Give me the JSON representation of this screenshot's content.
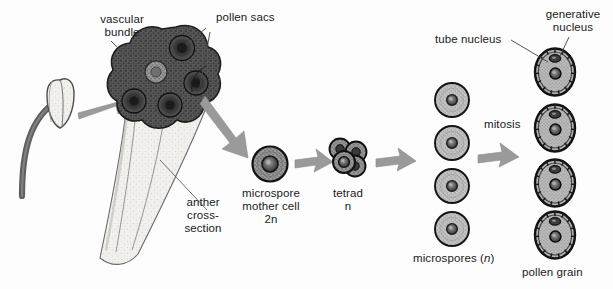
{
  "figure": {
    "background_color": "#fdfdfd",
    "ink_color": "#1a1a1a"
  },
  "colors": {
    "arrow_gray": "#9a9a9a",
    "arrow_gray_dark": "#8b8b8b",
    "sac_dark": "#555555",
    "sac_core": "#2e2e2e",
    "tissue_mid": "#6f6f6f",
    "cell_light": "#b5b5b5",
    "cell_mid": "#8e8e8e",
    "nucleus_dark": "#3a3a3a",
    "filament": "#6b6b6b",
    "anther_pale": "#e8e6e0",
    "leader_line": "#4a4a4a",
    "outline": "#111111"
  },
  "labels": {
    "vascular_bundle": "vascular\nbundle",
    "pollen_sacs": "pollen sacs",
    "anther_cross_section": "anther\ncross-\nsection",
    "microspore_mother_cell": "microspore\nmother cell\n2n",
    "tetrad": "tetrad\nn",
    "microspores_text": "microspores (",
    "microspores_italic": "n",
    "microspores_close": ")",
    "mitosis": "mitosis",
    "tube_nucleus": "tube nucleus",
    "generative_nucleus": "generative\nnucleus",
    "pollen_grain": "pollen grain"
  },
  "stages": [
    {
      "name": "stamen",
      "label": "",
      "count": 1
    },
    {
      "name": "anther-cross-section",
      "label": "anther cross-section",
      "pollen_sac_count": 4
    },
    {
      "name": "microspore-mother-cell",
      "label": "microspore mother cell 2n",
      "ploidy": "2n",
      "count": 1
    },
    {
      "name": "tetrad",
      "label": "tetrad n",
      "ploidy": "n",
      "cell_count": 4
    },
    {
      "name": "microspores",
      "label": "microspores (n)",
      "ploidy": "n",
      "count": 4
    },
    {
      "name": "pollen-grains",
      "label": "pollen grain",
      "count": 4,
      "nuclei": [
        "generative nucleus",
        "tube nucleus"
      ]
    }
  ],
  "arrows": [
    {
      "name": "arrow-stamen-to-section",
      "from": "stamen",
      "to": "anther-cross-section"
    },
    {
      "name": "arrow-section-to-mmc",
      "from": "anther-cross-section",
      "to": "microspore-mother-cell"
    },
    {
      "name": "arrow-mmc-to-tetrad",
      "from": "microspore-mother-cell",
      "to": "tetrad"
    },
    {
      "name": "arrow-tetrad-to-microspores",
      "from": "tetrad",
      "to": "microspores"
    },
    {
      "name": "arrow-microspores-to-pollen",
      "from": "microspores",
      "to": "pollen-grains",
      "process": "mitosis"
    }
  ]
}
